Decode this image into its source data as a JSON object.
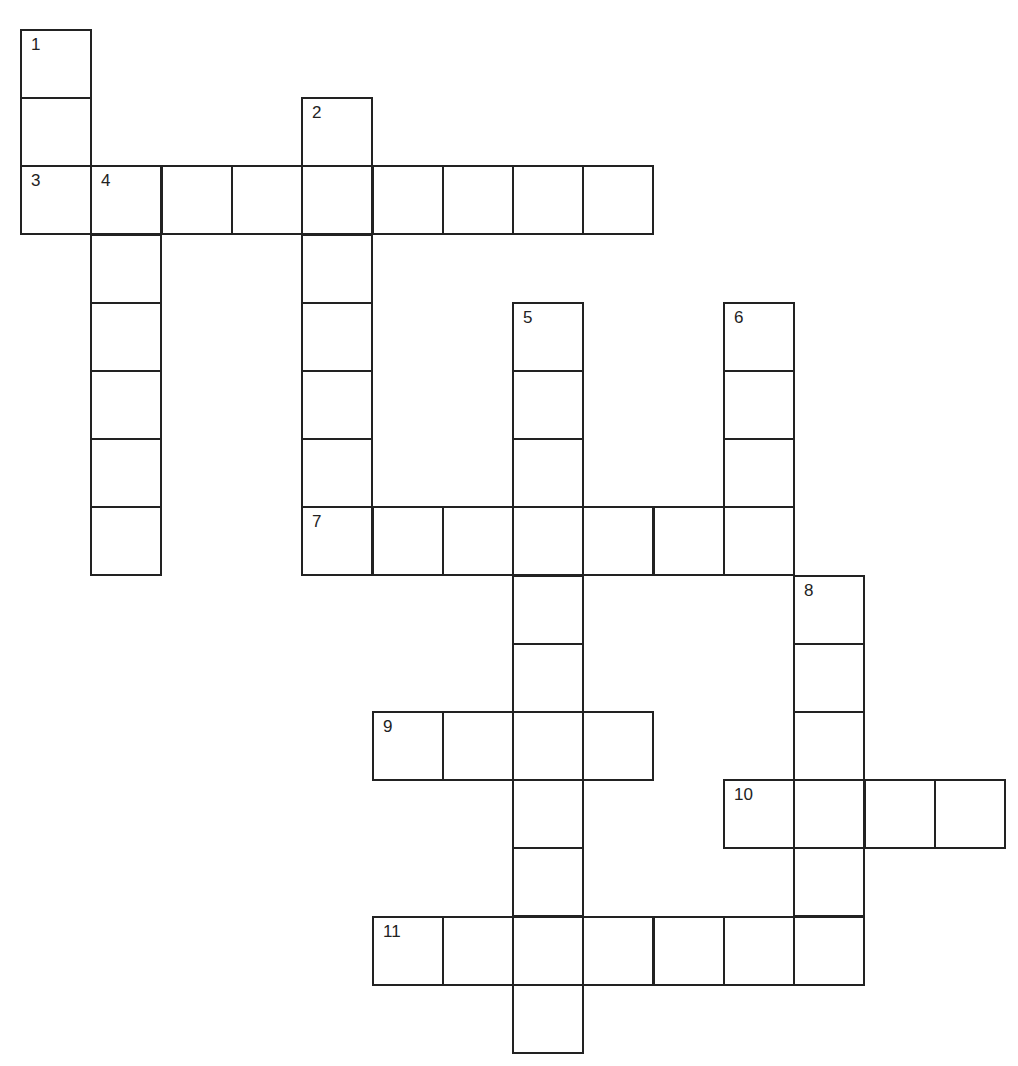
{
  "puzzle": {
    "type": "crossword",
    "origin": {
      "x": 21,
      "y": 30
    },
    "cell_size": {
      "w": 70.3,
      "h": 68.2
    },
    "line_color": "#222222",
    "entries": [
      {
        "number": "1",
        "direction": "down",
        "row": 0,
        "col": 0,
        "length": 3
      },
      {
        "number": "2",
        "direction": "down",
        "row": 1,
        "col": 4,
        "length": 7
      },
      {
        "number": "3",
        "direction": "across",
        "row": 2,
        "col": 0,
        "length": 9
      },
      {
        "number": "4",
        "direction": "down",
        "row": 2,
        "col": 1,
        "length": 6
      },
      {
        "number": "5",
        "direction": "down",
        "row": 4,
        "col": 7,
        "length": 11
      },
      {
        "number": "6",
        "direction": "down",
        "row": 4,
        "col": 10,
        "length": 4
      },
      {
        "number": "7",
        "direction": "across",
        "row": 7,
        "col": 4,
        "length": 7
      },
      {
        "number": "8",
        "direction": "down",
        "row": 8,
        "col": 11,
        "length": 6
      },
      {
        "number": "9",
        "direction": "across",
        "row": 10,
        "col": 5,
        "length": 4
      },
      {
        "number": "10",
        "direction": "across",
        "row": 11,
        "col": 10,
        "length": 4
      },
      {
        "number": "11",
        "direction": "across",
        "row": 13,
        "col": 5,
        "length": 7
      }
    ]
  }
}
